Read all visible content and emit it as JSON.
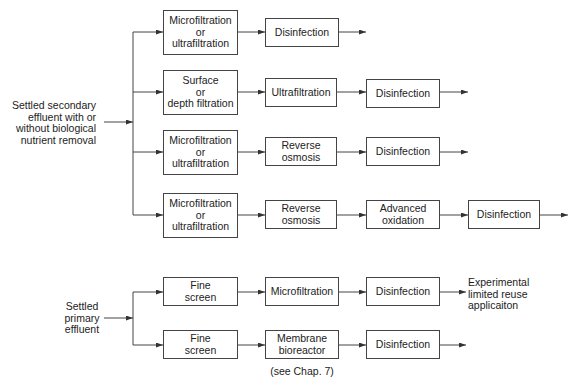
{
  "inputs": {
    "secondary": "Settled secondary\neffluent with or\nwithout biological\nnutrient removal",
    "primary": "Settled\nprimary\neffluent"
  },
  "flows": [
    {
      "steps": [
        "Microfiltration\nor\nultrafiltration",
        "Disinfection"
      ]
    },
    {
      "steps": [
        "Surface\nor\ndepth filtration",
        "Ultrafiltration",
        "Disinfection"
      ]
    },
    {
      "steps": [
        "Microfiltration\nor\nultrafiltration",
        "Reverse\nosmosis",
        "Disinfection"
      ]
    },
    {
      "steps": [
        "Microfiltration\nor\nultrafiltration",
        "Reverse\nosmosis",
        "Advanced\noxidation",
        "Disinfection"
      ]
    },
    {
      "steps": [
        "Fine\nscreen",
        "Microfiltration",
        "Disinfection"
      ],
      "output": "Experimental\nlimited reuse\napplicaiton"
    },
    {
      "steps": [
        "Fine\nscreen",
        "Membrane\nbioreactor",
        "Disinfection"
      ],
      "note": "(see Chap. 7)"
    }
  ]
}
